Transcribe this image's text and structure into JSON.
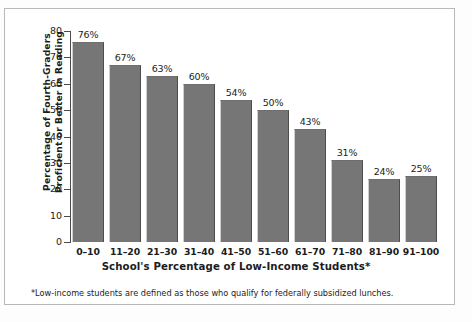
{
  "chart_data": {
    "type": "bar",
    "title": "",
    "subtitle": "",
    "xlabel": "School's Percentage of Low-Income Students*",
    "ylabel": "Percentage of Fourth-Graders Proficient or Better in Reading",
    "ylabel_line1": "Percentage of Fourth-Graders",
    "ylabel_line2": "Proficient or Better in Reading",
    "categories": [
      "0–10",
      "11–20",
      "21–30",
      "31–40",
      "41–50",
      "51–60",
      "61–70",
      "71–80",
      "81–90",
      "91–100"
    ],
    "values": [
      76,
      67,
      63,
      60,
      54,
      50,
      43,
      31,
      24,
      25
    ],
    "value_labels": [
      "76%",
      "67%",
      "63%",
      "60%",
      "54%",
      "50%",
      "43%",
      "31%",
      "24%",
      "25%"
    ],
    "ylim": [
      0,
      80
    ],
    "ytick_labels": [
      "0",
      "10",
      "20",
      "30",
      "40",
      "50",
      "60",
      "70",
      "80"
    ],
    "ytick_values": [
      0,
      10,
      20,
      30,
      40,
      50,
      60,
      70,
      80
    ],
    "grid": false,
    "legend": false,
    "legend_position": "none",
    "bar_color": "#767676",
    "axis_color": "#4a4a4a",
    "text_color": "#1c1c1c",
    "background_color": "#ffffff"
  },
  "footnote": "*Low-income students are defined as those who qualify for federally subsidized lunches."
}
